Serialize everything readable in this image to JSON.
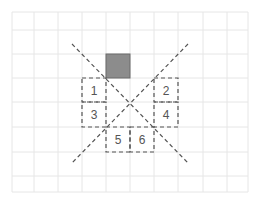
{
  "diagram": {
    "grid": {
      "x_lines": [
        12,
        34,
        58,
        82,
        106,
        130,
        154,
        178,
        203,
        227,
        248
      ],
      "y_lines": [
        12,
        30,
        54,
        78,
        102,
        127,
        152,
        176,
        192
      ],
      "color": "#e6e6e6"
    },
    "filled_square": {
      "x": 106,
      "y": 54,
      "w": 24,
      "h": 24,
      "fill": "#8c8c8c",
      "stroke": "#6a6a6a"
    },
    "dashed_boxes": [
      {
        "label": "1",
        "x": 82,
        "y": 78,
        "w": 24,
        "h": 24
      },
      {
        "label": "2",
        "x": 154,
        "y": 78,
        "w": 24,
        "h": 24
      },
      {
        "label": "3",
        "x": 82,
        "y": 102,
        "w": 24,
        "h": 25
      },
      {
        "label": "4",
        "x": 154,
        "y": 102,
        "w": 24,
        "h": 25
      },
      {
        "label": "5",
        "x": 106,
        "y": 127,
        "w": 24,
        "h": 25
      },
      {
        "label": "6",
        "x": 130,
        "y": 127,
        "w": 24,
        "h": 25
      }
    ],
    "diagonals": [
      {
        "x1": 72,
        "y1": 44,
        "x2": 188,
        "y2": 163
      },
      {
        "x1": 188,
        "y1": 44,
        "x2": 72,
        "y2": 163
      }
    ],
    "dash_color": "#555555"
  }
}
